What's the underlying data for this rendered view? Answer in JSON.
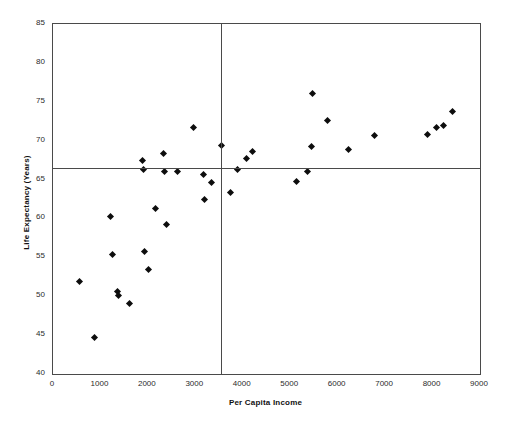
{
  "chart_data": {
    "type": "scatter",
    "title": "",
    "xlabel": "Per Capita Income",
    "ylabel": "Life Expectancy (Years)",
    "xlim": [
      0,
      9000
    ],
    "ylim": [
      40,
      85
    ],
    "xticks": [
      0,
      1000,
      2000,
      3000,
      4000,
      5000,
      6000,
      7000,
      8000,
      9000
    ],
    "yticks": [
      40,
      45,
      50,
      55,
      60,
      65,
      70,
      75,
      80,
      85
    ],
    "grid": false,
    "legend": "none",
    "marker": "diamond",
    "marker_color": "#0d0d0d",
    "axis_color": "#4a4a4a",
    "reference_lines": [
      {
        "orientation": "horizontal",
        "value": 66.5,
        "axis": "y",
        "label": "mean life expectancy"
      },
      {
        "orientation": "vertical",
        "value": 3550,
        "axis": "x",
        "label": "mean per capita income"
      }
    ],
    "points": [
      {
        "x": 560,
        "y": 51.9
      },
      {
        "x": 880,
        "y": 44.7
      },
      {
        "x": 1210,
        "y": 60.2
      },
      {
        "x": 1260,
        "y": 55.4
      },
      {
        "x": 1370,
        "y": 50.6
      },
      {
        "x": 1380,
        "y": 50.1
      },
      {
        "x": 1620,
        "y": 49.1
      },
      {
        "x": 1890,
        "y": 67.4
      },
      {
        "x": 1910,
        "y": 66.3
      },
      {
        "x": 1930,
        "y": 55.7
      },
      {
        "x": 2020,
        "y": 53.5
      },
      {
        "x": 2150,
        "y": 61.3
      },
      {
        "x": 2330,
        "y": 68.3
      },
      {
        "x": 2340,
        "y": 66.1
      },
      {
        "x": 2390,
        "y": 59.2
      },
      {
        "x": 2620,
        "y": 66.0
      },
      {
        "x": 2960,
        "y": 71.7
      },
      {
        "x": 3180,
        "y": 65.7
      },
      {
        "x": 3200,
        "y": 62.4
      },
      {
        "x": 3340,
        "y": 64.6
      },
      {
        "x": 3560,
        "y": 69.4
      },
      {
        "x": 3740,
        "y": 63.4
      },
      {
        "x": 3890,
        "y": 66.3
      },
      {
        "x": 4070,
        "y": 67.7
      },
      {
        "x": 4210,
        "y": 68.6
      },
      {
        "x": 5130,
        "y": 64.8
      },
      {
        "x": 5360,
        "y": 66.1
      },
      {
        "x": 5440,
        "y": 69.2
      },
      {
        "x": 5480,
        "y": 76.1
      },
      {
        "x": 5780,
        "y": 72.6
      },
      {
        "x": 6220,
        "y": 68.9
      },
      {
        "x": 6780,
        "y": 70.7
      },
      {
        "x": 7890,
        "y": 70.8
      },
      {
        "x": 8090,
        "y": 71.7
      },
      {
        "x": 8230,
        "y": 72.0
      },
      {
        "x": 8410,
        "y": 73.8
      }
    ]
  }
}
